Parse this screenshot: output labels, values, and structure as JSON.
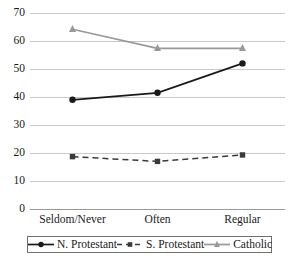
{
  "chart_data": {
    "type": "line",
    "title": "",
    "xlabel": "",
    "ylabel": "",
    "categories": [
      "Seldom/Never",
      "Often",
      "Regular"
    ],
    "ylim": [
      0,
      70
    ],
    "yticks": [
      0,
      10,
      20,
      30,
      40,
      50,
      60,
      70
    ],
    "ytick_labels": [
      "0",
      "10",
      "20",
      "30",
      "40",
      "50",
      "60",
      "70"
    ],
    "grid": true,
    "legend_position": "bottom",
    "series": [
      {
        "name": "N. Protestant",
        "values": [
          39.0,
          41.5,
          52.0
        ],
        "color": "#1a1a1a",
        "marker": "circle",
        "dash": "solid"
      },
      {
        "name": "S. Protestant",
        "values": [
          18.7,
          17.0,
          19.3
        ],
        "color": "#3a3a3a",
        "marker": "square",
        "dash": "dashed"
      },
      {
        "name": "Catholic",
        "values": [
          64.2,
          57.4,
          57.4
        ],
        "color": "#999999",
        "marker": "triangle",
        "dash": "solid"
      }
    ]
  },
  "axes": {
    "gridline_color": "#c9c9c9",
    "baseline_color": "#9a9a9a"
  }
}
